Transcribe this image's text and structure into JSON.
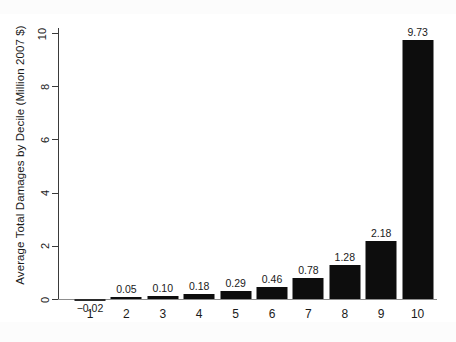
{
  "chart_data": {
    "type": "bar",
    "title": "",
    "subtitle": "",
    "xlabel": "",
    "ylabel": "Average Total Damages by Decile (Million 2007 $)",
    "categories": [
      "1",
      "2",
      "3",
      "4",
      "5",
      "6",
      "7",
      "8",
      "9",
      "10"
    ],
    "values": [
      -0.02,
      0.05,
      0.1,
      0.18,
      0.29,
      0.46,
      0.78,
      1.28,
      2.18,
      9.73
    ],
    "data_labels": [
      "−0.02",
      "0.05",
      "0.10",
      "0.18",
      "0.29",
      "0.46",
      "0.78",
      "1.28",
      "2.18",
      "9.73"
    ],
    "ylim": [
      -0.25,
      10.4
    ],
    "yticks": [
      0,
      2,
      4,
      6,
      8,
      10
    ],
    "ytick_labels": [
      "0",
      "2",
      "4",
      "6",
      "8",
      "10"
    ],
    "grid": false,
    "legend": null,
    "legend_position": "none",
    "bar_color": "#0d0d0d",
    "axis_color": "#3a3a3a",
    "background_color": "#ffffff"
  }
}
